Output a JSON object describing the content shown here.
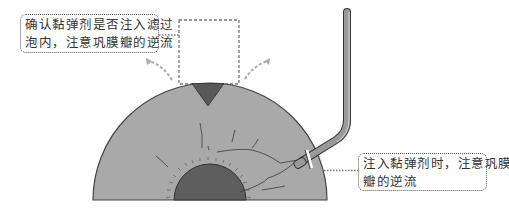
{
  "diagram": {
    "title": "",
    "callouts": {
      "top_left": {
        "lines": [
          "确认黏弹剂是否注入滤过",
          "泡内，注意巩膜瓣的逆流"
        ]
      },
      "bottom_right": {
        "lines": [
          "注入黏弹剂时，注意巩膜",
          "瓣的逆流"
        ]
      }
    },
    "colors": {
      "sclera": "#a9a9a9",
      "sclera_outline": "#444444",
      "iris_pupil": "#5e5e5e",
      "flap_notch": "#585858",
      "cannula": "#9a9a9a",
      "cannula_outline": "#333333",
      "dashed": "#8a8a8a",
      "background": "#ffffff"
    }
  }
}
